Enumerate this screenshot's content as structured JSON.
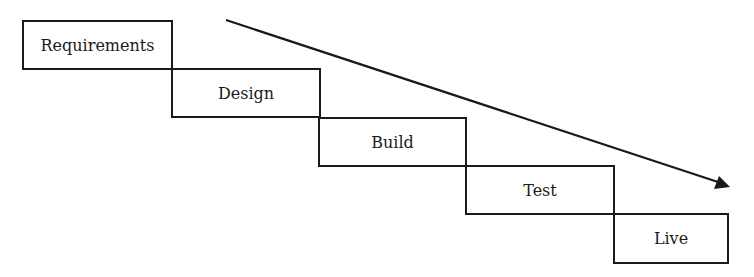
{
  "diagram": {
    "type": "waterfall",
    "stages": [
      {
        "label": "Requirements"
      },
      {
        "label": "Design"
      },
      {
        "label": "Build"
      },
      {
        "label": "Test"
      },
      {
        "label": "Live"
      }
    ],
    "arrow": {
      "direction": "down-right"
    },
    "line_color": "#1a1a1a"
  }
}
